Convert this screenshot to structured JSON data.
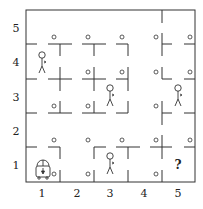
{
  "diagram": {
    "type": "grid-world",
    "rows": 5,
    "cols": 5,
    "x_axis_labels": [
      "1",
      "2",
      "3",
      "4",
      "5"
    ],
    "y_axis_labels": [
      "1",
      "2",
      "3",
      "4",
      "5"
    ],
    "colors": {
      "line": "#333333",
      "background": "#ffffff"
    },
    "agent": {
      "icon": "robot-icon",
      "cell": [
        1,
        1
      ]
    },
    "unknown_cell": {
      "cell": [
        5,
        1
      ],
      "label": "?"
    },
    "people": [
      {
        "icon": "person-icon",
        "cell": [
          1,
          4
        ]
      },
      {
        "icon": "person-icon",
        "cell": [
          3,
          3
        ]
      },
      {
        "icon": "person-icon",
        "cell": [
          5,
          3
        ]
      },
      {
        "icon": "person-icon",
        "cell": [
          3,
          1
        ]
      }
    ],
    "markers": {
      "icon": "circle-marker-icon",
      "count": 21
    }
  }
}
